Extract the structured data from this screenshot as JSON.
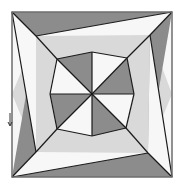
{
  "figure": {
    "colors": {
      "dark": "#8c8c8c",
      "light": "#d9d9d9",
      "white": "#f7f7f7",
      "stroke": "#1a1a1a",
      "frame": "#6e6e6e"
    },
    "regions": [
      {
        "name": "top-dark-triangle",
        "shade": "dark"
      },
      {
        "name": "top-right-dark-triangle",
        "shade": "dark"
      },
      {
        "name": "right-dark-triangle",
        "shade": "dark"
      },
      {
        "name": "bottom-dark-triangle",
        "shade": "dark"
      },
      {
        "name": "left-dark-triangle",
        "shade": "dark"
      },
      {
        "name": "center-dark-wedges",
        "shade": "dark"
      },
      {
        "name": "ring-light-bands",
        "shade": "light"
      },
      {
        "name": "white-corner-triangles",
        "shade": "white"
      }
    ]
  }
}
